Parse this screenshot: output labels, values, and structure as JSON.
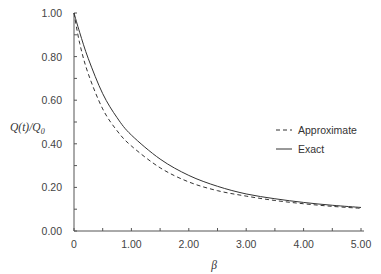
{
  "chart_data": {
    "type": "line",
    "title": "",
    "xlabel": "β",
    "ylabel": "Q(t)/Q0",
    "ylabel_parts": {
      "main": "Q(t)/Q",
      "sub": "0"
    },
    "xlim": [
      0,
      5
    ],
    "ylim": [
      0,
      1
    ],
    "x_ticks": [
      "0",
      "1.00",
      "2.00",
      "3.00",
      "4.00",
      "5.00"
    ],
    "y_ticks": [
      "0.00",
      "0.20",
      "0.40",
      "0.60",
      "0.80",
      "1.00"
    ],
    "grid": false,
    "legend_position": "right-middle",
    "x": [
      0,
      0.1,
      0.25,
      0.5,
      0.75,
      1.0,
      1.5,
      2.0,
      2.5,
      3.0,
      3.5,
      4.0,
      4.5,
      5.0
    ],
    "series": [
      {
        "name": "Approximate",
        "style": "dashed",
        "values": [
          1.0,
          0.86,
          0.72,
          0.56,
          0.46,
          0.39,
          0.29,
          0.225,
          0.185,
          0.16,
          0.14,
          0.125,
          0.113,
          0.104
        ]
      },
      {
        "name": "Exact",
        "style": "solid",
        "values": [
          1.0,
          0.91,
          0.79,
          0.63,
          0.52,
          0.44,
          0.33,
          0.255,
          0.205,
          0.17,
          0.148,
          0.131,
          0.118,
          0.108
        ]
      }
    ]
  },
  "legend": {
    "items": [
      {
        "label": "Approximate",
        "style": "dashed"
      },
      {
        "label": "Exact",
        "style": "solid"
      }
    ]
  },
  "colors": {
    "line": "#333333",
    "axis": "#555555"
  }
}
